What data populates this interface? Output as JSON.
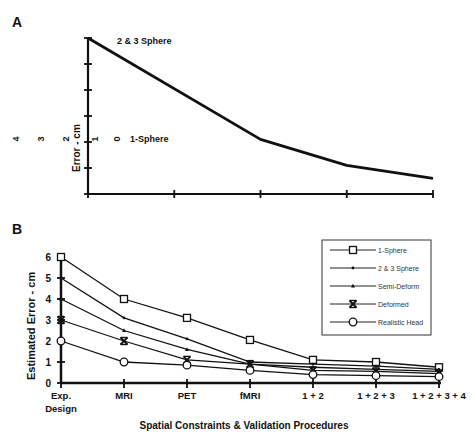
{
  "panel_a": {
    "panel_label": "A",
    "ylabel": "Error - cm",
    "y_tick_labels_rotated": [
      "4",
      "3",
      "2",
      "1",
      "0"
    ],
    "annotations": [
      "2 & 3 Sphere",
      "1-Sphere"
    ]
  },
  "panel_b": {
    "panel_label": "B",
    "ylabel": "Estimated Error - cm",
    "xlabel": "Spatial Constraints & Validation Procedures"
  },
  "chart_data": [
    {
      "type": "line",
      "title": "A",
      "xlabel": "",
      "ylabel": "Error - cm",
      "x": [
        0,
        1,
        2,
        3,
        4
      ],
      "series": [
        {
          "name": "Error curve",
          "values": [
            6.0,
            null,
            2.1,
            1.1,
            0.6
          ]
        }
      ],
      "annotations": [
        "2 & 3 Sphere",
        "1-Sphere"
      ],
      "ylim": [
        0,
        6
      ],
      "grid": false,
      "legend": "none"
    },
    {
      "type": "line",
      "title": "B",
      "xlabel": "Spatial Constraints & Validation Procedures",
      "ylabel": "Estimated Error - cm",
      "categories": [
        "Exp. Design",
        "MRI",
        "PET",
        "fMRI",
        "1 + 2",
        "1 + 2 + 3",
        "1 + 2 + 3 + 4"
      ],
      "y_ticks": [
        0,
        1,
        2,
        3,
        4,
        5,
        6
      ],
      "ylim": [
        0,
        6
      ],
      "grid": false,
      "legend": "upper right (boxed)",
      "series": [
        {
          "name": "1-Sphere",
          "marker": "square",
          "values": [
            6.0,
            4.0,
            3.1,
            2.05,
            1.1,
            1.0,
            0.75
          ]
        },
        {
          "name": "2 & 3 Sphere",
          "marker": "dot",
          "values": [
            5.0,
            3.1,
            2.1,
            1.0,
            0.9,
            0.8,
            0.65
          ]
        },
        {
          "name": "Semi-Deform",
          "marker": "triangle",
          "values": [
            4.0,
            2.5,
            1.6,
            0.9,
            0.75,
            0.65,
            0.55
          ]
        },
        {
          "name": "Deformed",
          "marker": "x-bar",
          "values": [
            3.0,
            2.0,
            1.1,
            0.9,
            0.6,
            0.55,
            0.45
          ]
        },
        {
          "name": "Realistic Head",
          "marker": "circle",
          "values": [
            2.0,
            1.0,
            0.85,
            0.6,
            0.4,
            0.35,
            0.3
          ]
        }
      ]
    }
  ]
}
